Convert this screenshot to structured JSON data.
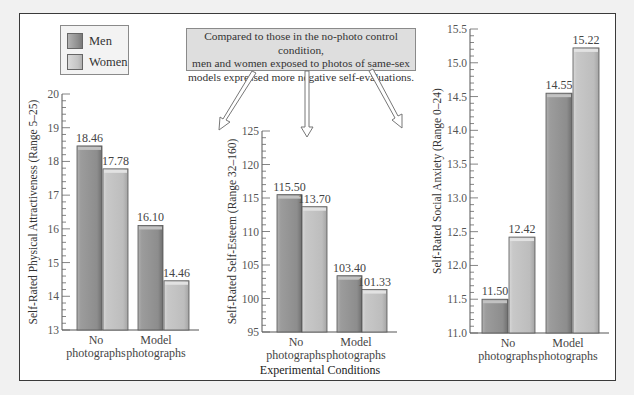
{
  "legend": {
    "items": [
      {
        "label": "Men",
        "color": "#9a9a9a"
      },
      {
        "label": "Women",
        "color": "#c6c6c6"
      }
    ]
  },
  "callout": {
    "lines": [
      "Compared to those in the no-photo control condition,",
      "men and women exposed to photos of same-sex",
      "models expressed more negative self-evaluations."
    ]
  },
  "x_axis_title": "Experimental Conditions",
  "chart_data": [
    {
      "type": "bar",
      "title": "",
      "xlabel": "",
      "ylabel": "Self-Rated Physical Attractiveness (Range 5–25)",
      "categories": [
        "No photographs",
        "Model photographs"
      ],
      "series": [
        {
          "name": "Men",
          "values": [
            18.46,
            16.1
          ]
        },
        {
          "name": "Women",
          "values": [
            17.78,
            14.46
          ]
        }
      ],
      "value_labels": [
        [
          "18.46",
          "16.10"
        ],
        [
          "17.78",
          "14.46"
        ]
      ],
      "ylim": [
        13,
        20
      ],
      "yticks": [
        "13",
        "14",
        "15",
        "16",
        "17",
        "18",
        "19",
        "20"
      ],
      "grid": false,
      "legend_position": "top-left"
    },
    {
      "type": "bar",
      "title": "",
      "xlabel": "Experimental Conditions",
      "ylabel": "Self-Rated Self-Esteem (Range 32–160)",
      "categories": [
        "No photographs",
        "Model photographs"
      ],
      "series": [
        {
          "name": "Men",
          "values": [
            115.5,
            103.4
          ]
        },
        {
          "name": "Women",
          "values": [
            113.7,
            101.33
          ]
        }
      ],
      "value_labels": [
        [
          "115.50",
          "103.40"
        ],
        [
          "113.70",
          "101.33"
        ]
      ],
      "ylim": [
        95,
        125
      ],
      "yticks": [
        "95",
        "100",
        "105",
        "110",
        "115",
        "120",
        "125"
      ],
      "grid": false
    },
    {
      "type": "bar",
      "title": "",
      "xlabel": "",
      "ylabel": "Self-Rated Social Anxiety (Range 0–24)",
      "categories": [
        "No photographs",
        "Model photographs"
      ],
      "series": [
        {
          "name": "Men",
          "values": [
            11.5,
            14.55
          ]
        },
        {
          "name": "Women",
          "values": [
            12.42,
            15.22
          ]
        }
      ],
      "value_labels": [
        [
          "11.50",
          "14.55"
        ],
        [
          "12.42",
          "15.22"
        ]
      ],
      "ylim": [
        11.0,
        15.5
      ],
      "yticks": [
        "11.0",
        "11.5",
        "12.0",
        "12.5",
        "13.0",
        "13.5",
        "14.0",
        "14.5",
        "15.0",
        "15.5"
      ],
      "grid": false
    }
  ],
  "layout": [
    {
      "axis_x": 62,
      "y_top": 94,
      "y_bottom": 330,
      "bar_x": [
        77,
        103,
        138,
        164
      ],
      "bar_w": 25,
      "minor_per_major": 5,
      "cat_x": [
        96,
        156
      ],
      "title_x": 37
    },
    {
      "axis_x": 262,
      "y_top": 131,
      "y_bottom": 332,
      "bar_x": [
        277,
        302,
        337,
        362
      ],
      "bar_w": 25,
      "minor_per_major": 5,
      "cat_x": [
        296,
        356
      ],
      "title_x": 236
    },
    {
      "axis_x": 470,
      "y_top": 29,
      "y_bottom": 333,
      "bar_x": [
        482,
        509,
        546,
        573
      ],
      "bar_w": 26,
      "minor_per_major": 5,
      "cat_x": [
        508,
        568
      ],
      "title_x": 441
    }
  ],
  "category_lines": [
    [
      "No",
      "photographs"
    ],
    [
      "Model",
      "photographs"
    ]
  ]
}
